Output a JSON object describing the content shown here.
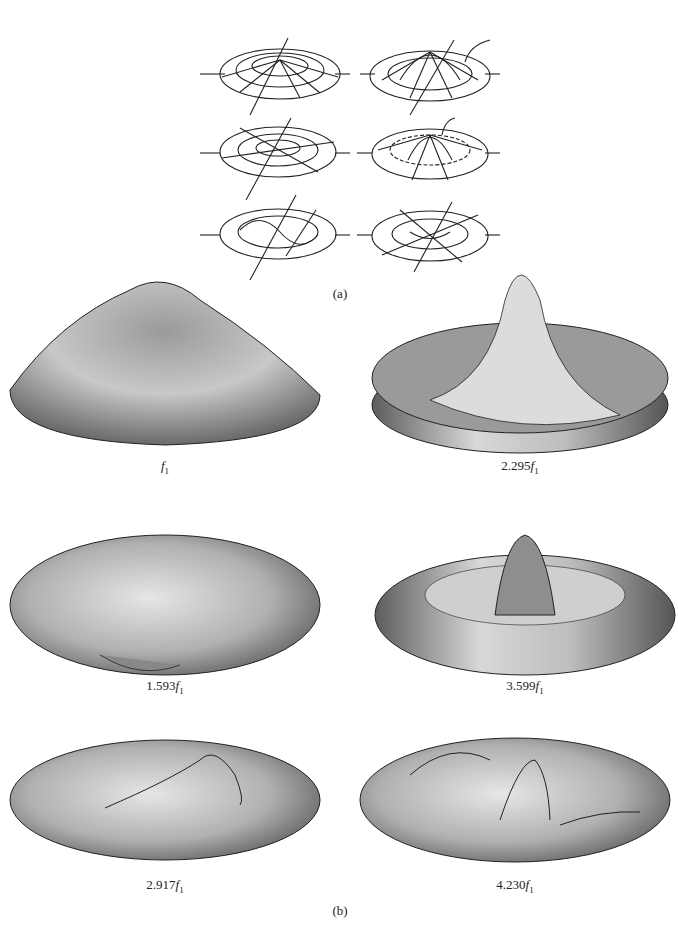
{
  "figure": {
    "part_a": {
      "label": "(a)",
      "panels": [
        {
          "row": 1,
          "col": 1,
          "description": "flat circular membrane wireframe with vertical axis"
        },
        {
          "row": 1,
          "col": 2,
          "description": "wireframe membrane with central peak"
        },
        {
          "row": 2,
          "col": 1,
          "description": "wireframe membrane with diametral nodal line, arrows"
        },
        {
          "row": 2,
          "col": 2,
          "description": "wireframe membrane with raised center and nodal circle"
        },
        {
          "row": 3,
          "col": 1,
          "description": "wireframe membrane with two nodal diameters, arrows"
        },
        {
          "row": 3,
          "col": 2,
          "description": "wireframe membrane with multiple nodal lines, arrows"
        }
      ]
    },
    "part_b": {
      "label": "(b)",
      "modes": [
        {
          "pos": "left-1",
          "coef": "",
          "sym": "f",
          "sub": "1"
        },
        {
          "pos": "right-1",
          "coef": "2.295",
          "sym": "f",
          "sub": "1"
        },
        {
          "pos": "left-2",
          "coef": "1.593",
          "sym": "f",
          "sub": "1"
        },
        {
          "pos": "right-2",
          "coef": "3.599",
          "sym": "f",
          "sub": "1"
        },
        {
          "pos": "left-3",
          "coef": "2.917",
          "sym": "f",
          "sub": "1"
        },
        {
          "pos": "right-3",
          "coef": "4.230",
          "sym": "f",
          "sub": "1"
        }
      ]
    }
  }
}
